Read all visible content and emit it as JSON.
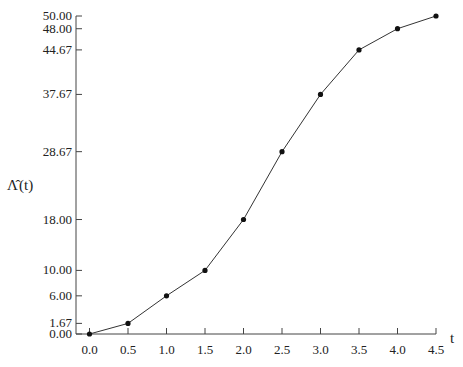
{
  "chart_data": {
    "type": "line",
    "title": "",
    "xlabel": "t",
    "ylabel": "Λ̂(t)",
    "x": [
      0.0,
      0.5,
      1.0,
      1.5,
      2.0,
      2.5,
      3.0,
      3.5,
      4.0,
      4.5
    ],
    "series": [
      {
        "name": "Λ̂(t)",
        "values": [
          0.0,
          1.67,
          6.0,
          10.0,
          18.0,
          28.67,
          37.67,
          44.67,
          48.0,
          50.0
        ],
        "markers": true
      }
    ],
    "xticks": [
      "0.0",
      "0.5",
      "1.0",
      "1.5",
      "2.0",
      "2.5",
      "3.0",
      "3.5",
      "4.0",
      "4.5"
    ],
    "yticks": [
      "0.00",
      "1.67",
      "6.00",
      "10.00",
      "18.00",
      "28.67",
      "37.67",
      "44.67",
      "48.00",
      "50.00"
    ],
    "xlim": [
      0.0,
      4.5
    ],
    "ylim": [
      0,
      50
    ],
    "grid": false,
    "legend": null
  },
  "axes": {
    "x_title": "t",
    "y_title_main": "Λ̂",
    "y_title_arg": "(t)"
  }
}
